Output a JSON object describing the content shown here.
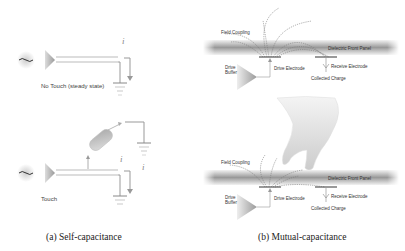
{
  "figure": {
    "panel_a": {
      "caption": "(a) Self-capacitance",
      "top_state": "No Touch (steady state)",
      "bottom_state": "Touch",
      "current_symbol": "i"
    },
    "panel_b": {
      "caption": "(b) Mutual-capacitance",
      "labels": {
        "field_coupling": "Field Coupling",
        "dielectric_front_panel": "Dielectric Front Panel",
        "drive_buffer": "Drive Buffer",
        "drive_electrode": "Drive Electrode",
        "receive_electrode": "Receive Electrode",
        "collected_charge": "Collected Charge"
      }
    }
  }
}
